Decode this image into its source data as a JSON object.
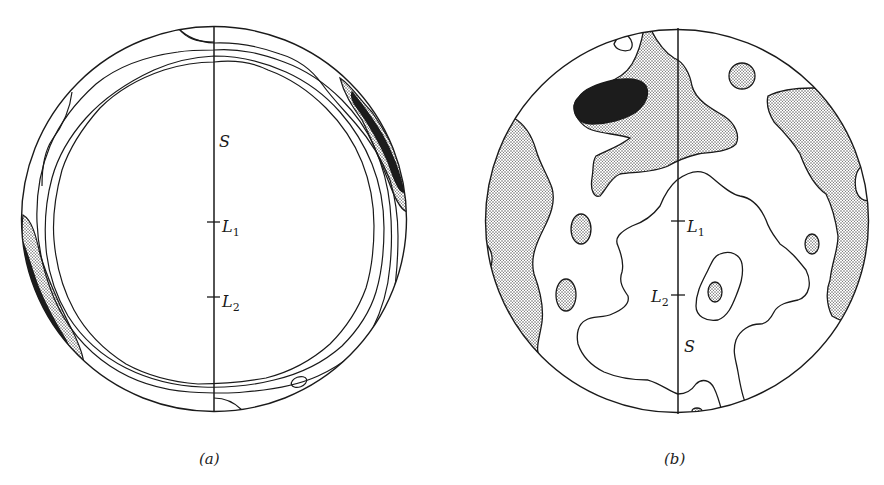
{
  "figure": {
    "panels": [
      {
        "id": "a",
        "caption": "(a)",
        "labels": {
          "s": "S",
          "l1": "L",
          "l1_sub": "1",
          "l2": "L",
          "l2_sub": "2"
        },
        "description": "Pole figure with concentric ring-like contours near the periphery; dense (dark) regions at upper-right and lower-left edges"
      },
      {
        "id": "b",
        "caption": "(b)",
        "labels": {
          "s": "S",
          "l1": "L",
          "l1_sub": "1",
          "l2": "L",
          "l2_sub": "2"
        },
        "description": "Pole figure with scattered stippled contour regions; dark maximum at upper-left, broad stippled bands at left and right edges"
      }
    ],
    "colors": {
      "line": "#1a1a1a",
      "stipple_light": "#bdbdbd",
      "dense_dark": "#1c1c1c",
      "background": "#ffffff"
    }
  }
}
